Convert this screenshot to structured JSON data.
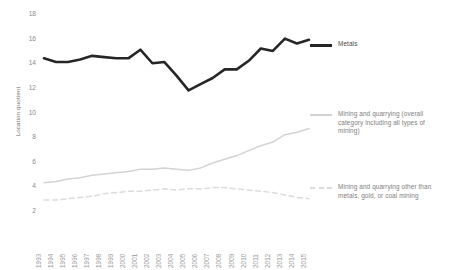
{
  "chart_data": {
    "type": "line",
    "title": "",
    "xlabel": "",
    "ylabel": "Location quotient",
    "ylim": [
      2,
      18
    ],
    "yticks": [
      18,
      16,
      14,
      12,
      10,
      8,
      6,
      4,
      2
    ],
    "grid": false,
    "legend_position": "right",
    "categories": [
      "1993",
      "1994",
      "1995",
      "1996",
      "1997",
      "1998",
      "1999",
      "2000",
      "2001",
      "2002",
      "2003",
      "2004",
      "2005",
      "2006",
      "2007",
      "2008",
      "2009",
      "2010",
      "2011",
      "2012",
      "2013",
      "2014",
      "2015"
    ],
    "series": [
      {
        "name": "Metals",
        "style": "solid",
        "color": "#262626",
        "values": [
          14.4,
          14.1,
          14.1,
          14.3,
          14.6,
          14.5,
          14.4,
          14.4,
          15.1,
          14.0,
          14.1,
          13.0,
          11.8,
          12.3,
          12.8,
          13.5,
          13.5,
          14.2,
          15.2,
          15.0,
          16.0,
          15.6,
          15.9
        ]
      },
      {
        "name": "Mining and quarrying (overall category including all types of mining)",
        "style": "solid",
        "color": "#d3d3d3",
        "values": [
          4.3,
          4.4,
          4.6,
          4.7,
          4.9,
          5.0,
          5.1,
          5.2,
          5.4,
          5.4,
          5.5,
          5.4,
          5.3,
          5.5,
          5.9,
          6.2,
          6.5,
          6.9,
          7.3,
          7.6,
          8.2,
          8.4,
          8.7
        ]
      },
      {
        "name": "Mining and quarrying other than metals, gold, or coal mining",
        "style": "dashed",
        "color": "#dcdcdc",
        "values": [
          2.9,
          2.9,
          3.0,
          3.1,
          3.2,
          3.4,
          3.5,
          3.6,
          3.6,
          3.7,
          3.8,
          3.7,
          3.8,
          3.8,
          3.9,
          3.9,
          3.8,
          3.7,
          3.6,
          3.5,
          3.3,
          3.1,
          3.0
        ]
      }
    ]
  },
  "legend": {
    "items": [
      {
        "label": "Metals",
        "color": "#262626",
        "style": "solid",
        "emphasis": "dark"
      },
      {
        "label": "Mining and quarrying (overall category including all types of mining)",
        "color": "#d3d3d3",
        "style": "solid",
        "emphasis": "light"
      },
      {
        "label": "Mining and quarrying other than metals, gold, or coal mining",
        "color": "#dcdcdc",
        "style": "dashed",
        "emphasis": "light"
      }
    ]
  }
}
